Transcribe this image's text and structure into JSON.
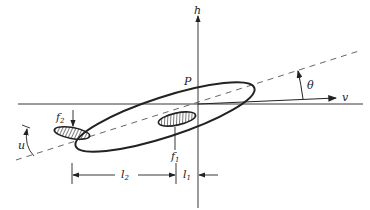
{
  "diagram": {
    "axes": {
      "vertical_label": "h",
      "horizontal_label": "v"
    },
    "labels": {
      "point": "P",
      "angle_theta": "θ",
      "angle_u": "u",
      "f1_main": "f",
      "f1_sub": "1",
      "f2_main": "f",
      "f2_sub": "2",
      "l1_main": "l",
      "l1_sub": "1",
      "l2_main": "l",
      "l2_sub": "2"
    },
    "colors": {
      "stroke": "#222222",
      "dash": "#555555",
      "background": "#ffffff"
    }
  }
}
